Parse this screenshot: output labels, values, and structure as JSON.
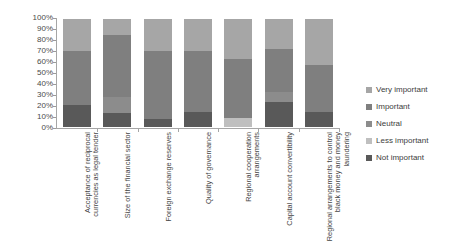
{
  "chart_data": {
    "type": "bar",
    "subtype": "stacked-100-percent",
    "title": "",
    "xlabel": "",
    "ylabel": "",
    "ylim": [
      0,
      100
    ],
    "grid": false,
    "legend_position": "right",
    "y_ticks": [
      "0%",
      "10%",
      "20%",
      "30%",
      "40%",
      "50%",
      "60%",
      "70%",
      "80%",
      "90%",
      "100%"
    ],
    "categories": [
      "Acceptance of reciprocal currencies as legal tender",
      "Size of the financial sector",
      "Foreign exchange reserves",
      "Quality of governance",
      "Regional cooperation arrangements",
      "Capital account convertibility",
      "Regional arrangements to control black money and money laundering"
    ],
    "series": [
      {
        "name": "Very important",
        "color": "#a6a6a6",
        "values": [
          30,
          15,
          30,
          30,
          37,
          28,
          43
        ]
      },
      {
        "name": "Important",
        "color": "#7f7f7f",
        "values": [
          50,
          57,
          63,
          56,
          55,
          40,
          43
        ]
      },
      {
        "name": "Neutral",
        "color": "#8c8c8c",
        "values": [
          0,
          15,
          0,
          0,
          0,
          9,
          0
        ]
      },
      {
        "name": "Less important",
        "color": "#bfbfbf",
        "values": [
          0,
          0,
          0,
          0,
          8,
          0,
          0
        ]
      },
      {
        "name": "Not important",
        "color": "#595959",
        "values": [
          20,
          13,
          7,
          14,
          0,
          23,
          14
        ]
      }
    ],
    "stack_order_bottom_to_top": [
      "Not important",
      "Less important",
      "Neutral",
      "Important",
      "Very important"
    ],
    "legend": [
      {
        "label": "Very important",
        "color": "#a6a6a6"
      },
      {
        "label": "Important",
        "color": "#7f7f7f"
      },
      {
        "label": "Neutral",
        "color": "#8c8c8c"
      },
      {
        "label": "Less important",
        "color": "#bfbfbf"
      },
      {
        "label": "Not important",
        "color": "#595959"
      }
    ]
  }
}
